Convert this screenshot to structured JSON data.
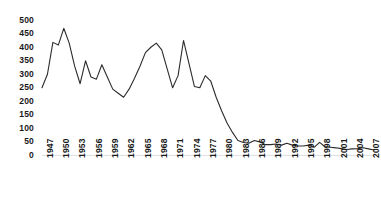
{
  "chart_data": {
    "type": "line",
    "title": "",
    "xlabel": "",
    "ylabel": "",
    "ylim": [
      0,
      500
    ],
    "ytick_step": 50,
    "yticks": [
      0,
      50,
      100,
      150,
      200,
      250,
      300,
      350,
      400,
      450,
      500
    ],
    "xtick_labels": [
      "1947",
      "1950",
      "1953",
      "1956",
      "1959",
      "1962",
      "1965",
      "1968",
      "1971",
      "1974",
      "1977",
      "1980",
      "1983",
      "1986",
      "1989",
      "1992",
      "1995",
      "1998",
      "2001",
      "2004",
      "2007"
    ],
    "xtick_step": 3,
    "grid": false,
    "legend": "none",
    "line_color": "#2b2b2b",
    "x": [
      1947,
      1948,
      1949,
      1950,
      1951,
      1952,
      1953,
      1954,
      1955,
      1956,
      1957,
      1958,
      1959,
      1960,
      1961,
      1962,
      1963,
      1964,
      1965,
      1966,
      1967,
      1968,
      1969,
      1970,
      1971,
      1972,
      1973,
      1974,
      1975,
      1976,
      1977,
      1978,
      1979,
      1980,
      1981,
      1982,
      1983,
      1984,
      1985,
      1986,
      1987,
      1988,
      1989,
      1990,
      1991,
      1992,
      1993,
      1994,
      1995,
      1996,
      1997,
      1998,
      1999,
      2000,
      2001,
      2002,
      2003,
      2004,
      2005,
      2006,
      2007,
      2008
    ],
    "values": [
      250,
      300,
      418,
      408,
      470,
      415,
      330,
      265,
      350,
      290,
      282,
      335,
      290,
      245,
      230,
      215,
      245,
      285,
      330,
      380,
      400,
      415,
      390,
      320,
      250,
      295,
      425,
      340,
      255,
      250,
      295,
      275,
      215,
      165,
      120,
      85,
      55,
      48,
      45,
      55,
      50,
      40,
      40,
      42,
      38,
      45,
      38,
      35,
      35,
      38,
      30,
      48,
      32,
      30,
      28,
      25,
      22,
      24,
      25,
      28,
      24,
      20
    ],
    "series": [
      {
        "name": "series-1",
        "values": [
          250,
          300,
          418,
          408,
          470,
          415,
          330,
          265,
          350,
          290,
          282,
          335,
          290,
          245,
          230,
          215,
          245,
          285,
          330,
          380,
          400,
          415,
          390,
          320,
          250,
          295,
          425,
          340,
          255,
          250,
          295,
          275,
          215,
          165,
          120,
          85,
          55,
          48,
          45,
          55,
          50,
          40,
          40,
          42,
          38,
          45,
          38,
          35,
          35,
          38,
          30,
          48,
          32,
          30,
          28,
          25,
          22,
          24,
          25,
          28,
          24,
          20
        ]
      }
    ]
  }
}
